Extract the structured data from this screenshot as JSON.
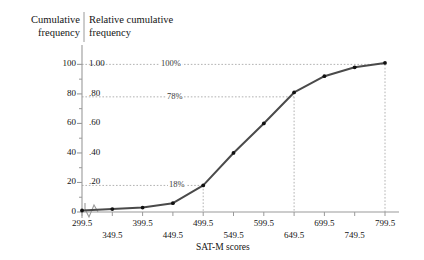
{
  "figure": {
    "left_axis_title": "Cumulative\nfrequency",
    "right_axis_title": "Relative cumulative\nfrequency",
    "x_axis_title": "SAT-M scores"
  },
  "chart_data": {
    "type": "line",
    "title": "",
    "xlabel": "SAT-M scores",
    "ylabel": "Cumulative frequency",
    "ylabel_secondary": "Relative cumulative frequency",
    "x": [
      299.5,
      349.5,
      399.5,
      449.5,
      499.5,
      549.5,
      599.5,
      649.5,
      699.5,
      749.5,
      799.5
    ],
    "values": [
      1,
      2,
      3,
      6,
      18,
      40,
      60,
      81,
      92,
      98,
      101
    ],
    "xlim": [
      299.5,
      799.5
    ],
    "ylim": [
      0,
      105
    ],
    "grid": false,
    "legend": null,
    "axis_break_x": true,
    "y_ticks_left": [
      0,
      20,
      40,
      60,
      80,
      100
    ],
    "y_tick_labels_left": [
      "0",
      "20",
      "40",
      "60",
      "80",
      "100"
    ],
    "y_ticks_right": [
      20,
      40,
      60,
      80,
      100
    ],
    "y_tick_labels_right": [
      ".20",
      ".40",
      ".60",
      ".80",
      "1.00"
    ],
    "y_minor_ticks": [
      10,
      30,
      50,
      70,
      90
    ],
    "x_ticks": [
      299.5,
      349.5,
      399.5,
      449.5,
      499.5,
      549.5,
      599.5,
      649.5,
      699.5,
      749.5,
      799.5
    ],
    "x_tick_labels": [
      "299.5",
      "349.5",
      "399.5",
      "449.5",
      "499.5",
      "549.5",
      "599.5",
      "649.5",
      "699.5",
      "749.5",
      "799.5"
    ],
    "annotations": [
      {
        "label": "100%",
        "y": 100,
        "x_from": 299.5,
        "x_to": 799.5,
        "style": "dotted-horizontal"
      },
      {
        "label": "78%",
        "y": 78,
        "x_from": 299.5,
        "x_to": 649.5,
        "style": "dotted-horizontal"
      },
      {
        "label": "18%",
        "y": 18,
        "x_from": 299.5,
        "x_to": 499.5,
        "style": "dotted-horizontal"
      }
    ],
    "drop_lines": [
      {
        "x": 499.5,
        "y": 18
      },
      {
        "x": 649.5,
        "y": 78
      },
      {
        "x": 799.5,
        "y": 100
      }
    ]
  },
  "colors": {
    "curve": "#4a4a4a",
    "marker": "#111111",
    "axis": "#9a9a9a",
    "dotted": "#a9a9a9",
    "text": "#141414"
  }
}
